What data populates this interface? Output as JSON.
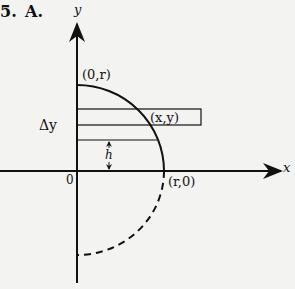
{
  "problem": {
    "number": "5.",
    "letter": "A."
  },
  "axes": {
    "x_label": "x",
    "y_label": "y",
    "origin_label": "0"
  },
  "points": {
    "top": "(0,r)",
    "right": "(r,0)",
    "strip_corner": "(x,y)"
  },
  "annotations": {
    "delta_y": "Δy",
    "height": "h"
  },
  "colors": {
    "line": "#111111",
    "background": "#f3f3f1"
  }
}
